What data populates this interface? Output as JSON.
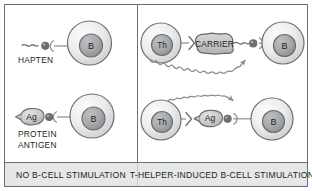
{
  "figure": {
    "title_hidden": "",
    "panels": [
      {
        "id": "left",
        "caption": "NO B-CELL STIMULATION",
        "rows": [
          {
            "id": "hapten-row",
            "label": "HAPTEN",
            "antigen_label": "",
            "cell_labels": [
              "B"
            ],
            "signal": "none"
          },
          {
            "id": "protein-antigen-row",
            "label": "PROTEIN\nANTIGEN",
            "label_line1": "PROTEIN",
            "label_line2": "ANTIGEN",
            "antigen_label": "Ag",
            "cell_labels": [
              "B"
            ],
            "signal": "none"
          }
        ]
      },
      {
        "id": "right",
        "caption": "T-HELPER-INDUCED B-CELL STIMULATION",
        "rows": [
          {
            "id": "carrier-row",
            "label": "",
            "antigen_label": "CARRIER",
            "cell_labels": [
              "Th",
              "B"
            ],
            "signal": "wavy-arrow"
          },
          {
            "id": "ag-row",
            "label": "",
            "antigen_label": "Ag",
            "cell_labels": [
              "Th",
              "B"
            ],
            "signal": "wavy-arrow"
          }
        ]
      }
    ],
    "cells": {
      "b_label": "B",
      "th_label": "Th"
    },
    "colors": {
      "frame_border": "#6d6e71",
      "divider": "#6d6e71",
      "caption_bg": "#e6e7e8",
      "text": "#231f20",
      "cell_outline": "#58595b",
      "cell_fill_light": "#f2f2f2",
      "cell_fill_mid": "#d9d9d9",
      "nucleus_fill": "#a7a9ac",
      "nucleus_outline": "#58595b",
      "antigen_fill": "#c4c6c8",
      "antigen_outline": "#58595b",
      "receptor_line": "#808285",
      "signal_arrow": "#808285"
    }
  }
}
